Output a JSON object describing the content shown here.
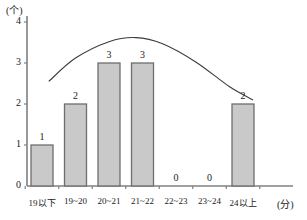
{
  "chart_data": {
    "type": "bar",
    "title": "",
    "subtitle": "",
    "xlabel": "(分)",
    "ylabel": "(个)",
    "categories": [
      "19以下",
      "19~20",
      "20~21",
      "21~22",
      "22~23",
      "23~24",
      "24以上"
    ],
    "values": [
      1,
      2,
      3,
      3,
      0,
      0,
      2
    ],
    "value_labels": [
      "1",
      "2",
      "3",
      "3",
      "0",
      "0",
      "2"
    ],
    "ylim": [
      0,
      4
    ],
    "yticks": [
      0,
      1,
      2,
      3,
      4
    ],
    "ytick_labels": [
      "0",
      "1",
      "2",
      "3",
      "4"
    ],
    "grid": false,
    "legend": "none",
    "series": [
      {
        "name": "频数",
        "type": "bar",
        "values": [
          1,
          2,
          3,
          3,
          0,
          0,
          2
        ]
      },
      {
        "name": "正态分布曲线",
        "type": "line",
        "smooth": true,
        "points": [
          {
            "x": 0.2,
            "y": 2.55
          },
          {
            "x": 1.0,
            "y": 3.12
          },
          {
            "x": 2.0,
            "y": 3.52
          },
          {
            "x": 2.8,
            "y": 3.62
          },
          {
            "x": 3.6,
            "y": 3.47
          },
          {
            "x": 4.6,
            "y": 3.02
          },
          {
            "x": 5.6,
            "y": 2.42
          },
          {
            "x": 6.3,
            "y": 2.1
          }
        ]
      }
    ],
    "colors": {
      "bar_fill": "#c9c9c9",
      "bar_stroke": "#6e6e6e",
      "axis": "#808080",
      "curve": "#3c3c3c",
      "text": "#1a1a1a"
    }
  }
}
